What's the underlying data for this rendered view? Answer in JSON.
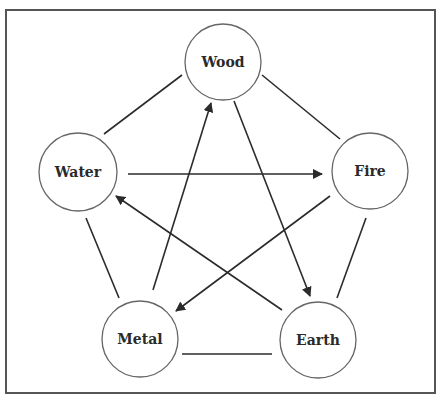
{
  "diagram": {
    "type": "five-elements-cycle",
    "frame": {
      "x": 6,
      "y": 10,
      "width": 429,
      "height": 383,
      "stroke": "#555555"
    },
    "colors": {
      "line": "#2b2b2b",
      "circle_stroke": "#666666",
      "text": "#2a2a2a",
      "background": "#ffffff"
    },
    "nodes": [
      {
        "id": "wood",
        "label": "Wood",
        "cx": 223,
        "cy": 62,
        "r": 38
      },
      {
        "id": "water",
        "label": "Water",
        "cx": 78,
        "cy": 172,
        "r": 39
      },
      {
        "id": "fire",
        "label": "Fire",
        "cx": 370,
        "cy": 171,
        "r": 38
      },
      {
        "id": "metal",
        "label": "Metal",
        "cx": 140,
        "cy": 339,
        "r": 38
      },
      {
        "id": "earth",
        "label": "Earth",
        "cx": 318,
        "cy": 340,
        "r": 38
      }
    ],
    "undirected_edges": [
      {
        "from": "water",
        "to": "wood",
        "x1": 104,
        "y1": 134,
        "x2": 182,
        "y2": 75
      },
      {
        "from": "wood",
        "to": "fire",
        "x1": 262,
        "y1": 75,
        "x2": 340,
        "y2": 139
      },
      {
        "from": "water",
        "to": "metal",
        "x1": 86,
        "y1": 218,
        "x2": 119,
        "y2": 298
      },
      {
        "from": "fire",
        "to": "earth",
        "x1": 366,
        "y1": 218,
        "x2": 337,
        "y2": 298
      },
      {
        "from": "metal",
        "to": "earth",
        "x1": 182,
        "y1": 354,
        "x2": 272,
        "y2": 354
      }
    ],
    "directed_edges": [
      {
        "from": "water",
        "to": "fire",
        "x1": 128,
        "y1": 174,
        "x2": 322,
        "y2": 174
      },
      {
        "from": "metal",
        "to": "wood",
        "x1": 153,
        "y1": 290,
        "x2": 211,
        "y2": 103
      },
      {
        "from": "wood",
        "to": "earth",
        "x1": 234,
        "y1": 101,
        "x2": 310,
        "y2": 296
      },
      {
        "from": "fire",
        "to": "metal",
        "x1": 330,
        "y1": 196,
        "x2": 176,
        "y2": 311
      },
      {
        "from": "earth",
        "to": "water",
        "x1": 282,
        "y1": 310,
        "x2": 116,
        "y2": 196
      }
    ]
  }
}
